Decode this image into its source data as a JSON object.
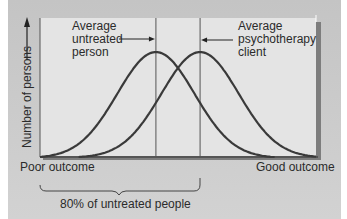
{
  "chart_data": {
    "type": "line",
    "title": "",
    "xlabel": "",
    "ylabel": "Number of persons",
    "x_range": [
      0,
      100
    ],
    "y_range": [
      0,
      1
    ],
    "grid": false,
    "x_end_labels": {
      "left": "Poor outcome",
      "right": "Good outcome"
    },
    "series": [
      {
        "name": "Untreated people",
        "mean": 42,
        "sd": 14,
        "start": 0,
        "end": 85
      },
      {
        "name": "Psychotherapy clients",
        "mean": 58,
        "sd": 14,
        "start": 14,
        "end": 100
      }
    ],
    "reference_lines": [
      {
        "x": 42,
        "label": "Average untreated person"
      },
      {
        "x": 58,
        "label": "Average psychotherapy client"
      }
    ],
    "annotations": [
      {
        "text_lines": [
          "Average",
          "untreated",
          "person"
        ],
        "points_to": "Average untreated person line",
        "side": "left"
      },
      {
        "text_lines": [
          "Average",
          "psychotherapy",
          "client"
        ],
        "points_to": "Average psychotherapy client line",
        "side": "right"
      },
      {
        "text": "80% of untreated people",
        "type": "brace",
        "from_x": 0,
        "to_x": 58
      }
    ],
    "colors": {
      "curve": "#3a3a3a",
      "background": "#cfcfcf",
      "plot_fill": "#e6e6e6"
    }
  }
}
